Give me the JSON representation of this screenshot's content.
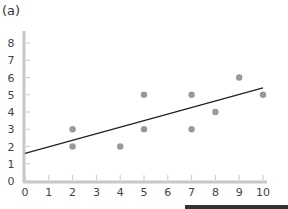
{
  "panel_label": "(a)",
  "colors": {
    "axis": "#c8c8c8",
    "tick": "#c8c8c8",
    "point": "#999999",
    "line": "#222222",
    "text": "#444444",
    "bottom_bar": "#333333"
  },
  "chart_data": {
    "type": "scatter",
    "title": "",
    "xlabel": "",
    "ylabel": "",
    "xlim": [
      0,
      10
    ],
    "ylim": [
      0,
      8
    ],
    "x_ticks": [
      0,
      1,
      2,
      3,
      4,
      5,
      6,
      7,
      8,
      9,
      10
    ],
    "y_ticks": [
      0,
      1,
      2,
      3,
      4,
      5,
      6,
      7,
      8
    ],
    "grid": false,
    "series": [
      {
        "name": "data",
        "points": [
          [
            2,
            3
          ],
          [
            2,
            2
          ],
          [
            4,
            2
          ],
          [
            5,
            5
          ],
          [
            5,
            3
          ],
          [
            7,
            5
          ],
          [
            7,
            3
          ],
          [
            8,
            4
          ],
          [
            9,
            6
          ],
          [
            10,
            5
          ]
        ]
      }
    ],
    "trend_line": {
      "x": [
        0,
        10
      ],
      "y": [
        1.6,
        5.4
      ]
    }
  }
}
